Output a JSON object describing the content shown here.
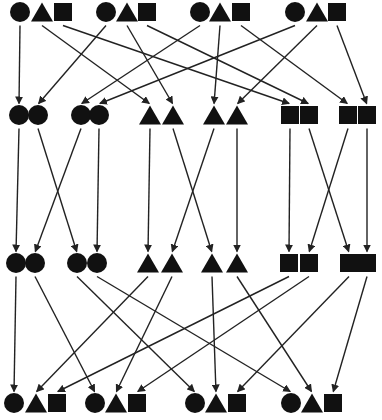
{
  "diagram": {
    "colors": {
      "shape": "#111111",
      "line": "#222222",
      "background": "#ffffff"
    },
    "rows": {
      "row1": {
        "y": 12,
        "nodes": [
          {
            "id": "r1c1",
            "shape": "circle",
            "x": 20
          },
          {
            "id": "r1t1",
            "shape": "triangle",
            "x": 42
          },
          {
            "id": "r1s1",
            "shape": "square",
            "x": 63
          },
          {
            "id": "r1c2",
            "shape": "circle",
            "x": 106
          },
          {
            "id": "r1t2",
            "shape": "triangle",
            "x": 127
          },
          {
            "id": "r1s2",
            "shape": "square",
            "x": 147
          },
          {
            "id": "r1c3",
            "shape": "circle",
            "x": 200
          },
          {
            "id": "r1t3",
            "shape": "triangle",
            "x": 220
          },
          {
            "id": "r1s3",
            "shape": "square",
            "x": 241
          },
          {
            "id": "r1c4",
            "shape": "circle",
            "x": 295
          },
          {
            "id": "r1t4",
            "shape": "triangle",
            "x": 317
          },
          {
            "id": "r1s4",
            "shape": "square",
            "x": 337
          }
        ]
      },
      "row2": {
        "y": 115,
        "nodes": [
          {
            "id": "r2a",
            "shape": "circle",
            "x": 19
          },
          {
            "id": "r2b",
            "shape": "circle",
            "x": 38
          },
          {
            "id": "r2c",
            "shape": "circle",
            "x": 81
          },
          {
            "id": "r2d",
            "shape": "circle",
            "x": 99
          },
          {
            "id": "r2e",
            "shape": "triangle",
            "x": 150
          },
          {
            "id": "r2f",
            "shape": "triangle",
            "x": 173
          },
          {
            "id": "r2g",
            "shape": "triangle",
            "x": 214
          },
          {
            "id": "r2h",
            "shape": "triangle",
            "x": 237
          },
          {
            "id": "r2i",
            "shape": "square",
            "x": 290
          },
          {
            "id": "r2j",
            "shape": "square",
            "x": 309
          },
          {
            "id": "r2k",
            "shape": "square",
            "x": 348
          },
          {
            "id": "r2l",
            "shape": "square",
            "x": 367
          }
        ]
      },
      "row3": {
        "y": 263,
        "nodes": [
          {
            "id": "r3a",
            "shape": "circle",
            "x": 16
          },
          {
            "id": "r3b",
            "shape": "circle",
            "x": 35
          },
          {
            "id": "r3c",
            "shape": "circle",
            "x": 77
          },
          {
            "id": "r3d",
            "shape": "circle",
            "x": 97
          },
          {
            "id": "r3e",
            "shape": "triangle",
            "x": 148
          },
          {
            "id": "r3f",
            "shape": "triangle",
            "x": 172
          },
          {
            "id": "r3g",
            "shape": "triangle",
            "x": 212
          },
          {
            "id": "r3h",
            "shape": "triangle",
            "x": 237
          },
          {
            "id": "r3i",
            "shape": "square",
            "x": 289
          },
          {
            "id": "r3j",
            "shape": "square",
            "x": 309
          },
          {
            "id": "r3k",
            "shape": "square",
            "x": 349
          },
          {
            "id": "r3l",
            "shape": "square",
            "x": 367
          }
        ]
      },
      "row4": {
        "y": 403,
        "nodes": [
          {
            "id": "r4c1",
            "shape": "circle",
            "x": 14
          },
          {
            "id": "r4t1",
            "shape": "triangle",
            "x": 36
          },
          {
            "id": "r4s1",
            "shape": "square",
            "x": 57
          },
          {
            "id": "r4c2",
            "shape": "circle",
            "x": 95
          },
          {
            "id": "r4t2",
            "shape": "triangle",
            "x": 116
          },
          {
            "id": "r4s2",
            "shape": "square",
            "x": 137
          },
          {
            "id": "r4c3",
            "shape": "circle",
            "x": 195
          },
          {
            "id": "r4t3",
            "shape": "triangle",
            "x": 216
          },
          {
            "id": "r4s3",
            "shape": "square",
            "x": 237
          },
          {
            "id": "r4c4",
            "shape": "circle",
            "x": 291
          },
          {
            "id": "r4t4",
            "shape": "triangle",
            "x": 312
          },
          {
            "id": "r4s4",
            "shape": "square",
            "x": 333
          }
        ]
      }
    },
    "edges": [
      [
        "r1c1",
        "r2a"
      ],
      [
        "r1c2",
        "r2b"
      ],
      [
        "r1c3",
        "r2c"
      ],
      [
        "r1c4",
        "r2d"
      ],
      [
        "r1t1",
        "r2e"
      ],
      [
        "r1t2",
        "r2f"
      ],
      [
        "r1t3",
        "r2g"
      ],
      [
        "r1t4",
        "r2h"
      ],
      [
        "r1s1",
        "r2i"
      ],
      [
        "r1s2",
        "r2j"
      ],
      [
        "r1s3",
        "r2k"
      ],
      [
        "r1s4",
        "r2l"
      ],
      [
        "r2a",
        "r3a"
      ],
      [
        "r2b",
        "r3c"
      ],
      [
        "r2c",
        "r3b"
      ],
      [
        "r2d",
        "r3d"
      ],
      [
        "r2e",
        "r3e"
      ],
      [
        "r2f",
        "r3g"
      ],
      [
        "r2g",
        "r3f"
      ],
      [
        "r2h",
        "r3h"
      ],
      [
        "r2i",
        "r3i"
      ],
      [
        "r2j",
        "r3k"
      ],
      [
        "r2k",
        "r3j"
      ],
      [
        "r2l",
        "r3l"
      ],
      [
        "r3a",
        "r4c1"
      ],
      [
        "r3b",
        "r4c2"
      ],
      [
        "r3c",
        "r4c3"
      ],
      [
        "r3d",
        "r4c4"
      ],
      [
        "r3e",
        "r4t1"
      ],
      [
        "r3f",
        "r4t2"
      ],
      [
        "r3g",
        "r4t3"
      ],
      [
        "r3h",
        "r4t4"
      ],
      [
        "r3i",
        "r4s1"
      ],
      [
        "r3j",
        "r4s2"
      ],
      [
        "r3k",
        "r4s3"
      ],
      [
        "r3l",
        "r4s4"
      ]
    ]
  }
}
